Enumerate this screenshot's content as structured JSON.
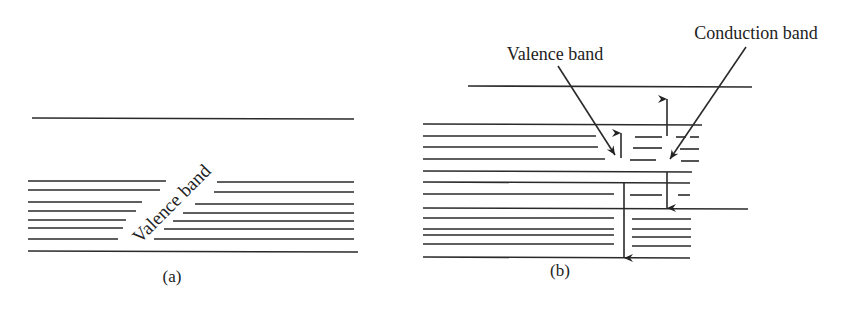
{
  "figure": {
    "panel_a": {
      "caption": "(a)",
      "band_label": "Valence band"
    },
    "panel_b": {
      "caption": "(b)",
      "valence_label": "Valence band",
      "conduction_label": "Conduction band"
    },
    "colors": {
      "line": "#2a2a2a",
      "background": "#ffffff"
    }
  }
}
